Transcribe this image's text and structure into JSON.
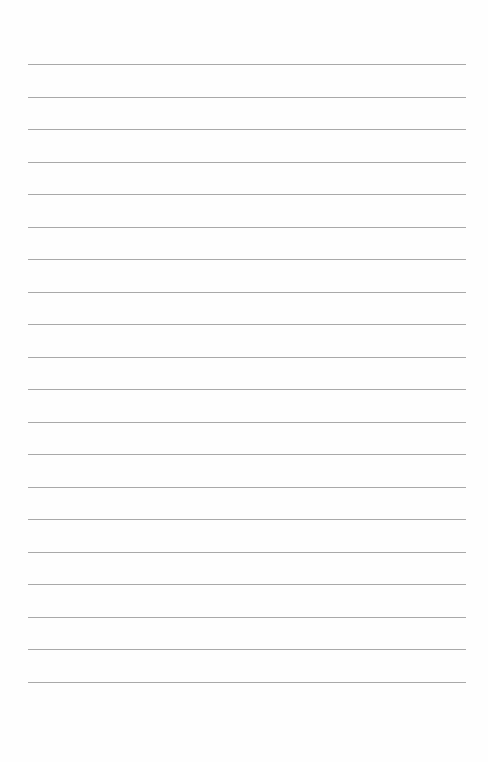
{
  "page": {
    "type": "blank-lined-paper",
    "line_count": 20,
    "line_color": "#9a9a9a",
    "background_color": "#fefefe",
    "first_line_y": 64,
    "line_spacing": 32.5,
    "line_left": 28,
    "line_width": 438
  }
}
